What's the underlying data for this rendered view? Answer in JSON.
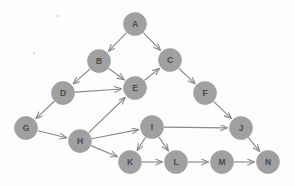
{
  "figure": {
    "kind": "directed-graph",
    "title": "",
    "background_color": "#fdfdfd",
    "node_fill_color": "#a0a0a0",
    "node_label_color": "#4a4a4a",
    "edge_color": "#8a8a8a",
    "node_radius": 11.5,
    "width": 295,
    "height": 186
  },
  "nodes": [
    {
      "id": "A",
      "label": "A",
      "x": 135,
      "y": 24
    },
    {
      "id": "B",
      "label": "B",
      "x": 99,
      "y": 61
    },
    {
      "id": "C",
      "label": "C",
      "x": 170,
      "y": 60
    },
    {
      "id": "D",
      "label": "D",
      "x": 63,
      "y": 93
    },
    {
      "id": "E",
      "label": "E",
      "x": 135,
      "y": 88
    },
    {
      "id": "F",
      "label": "F",
      "x": 205,
      "y": 93
    },
    {
      "id": "G",
      "label": "G",
      "x": 26,
      "y": 128
    },
    {
      "id": "H",
      "label": "H",
      "x": 80,
      "y": 141
    },
    {
      "id": "I",
      "label": "I",
      "x": 152,
      "y": 127
    },
    {
      "id": "J",
      "label": "J",
      "x": 241,
      "y": 128
    },
    {
      "id": "K",
      "label": "K",
      "x": 130,
      "y": 162
    },
    {
      "id": "L",
      "label": "L",
      "x": 176,
      "y": 162
    },
    {
      "id": "M",
      "label": "M",
      "x": 222,
      "y": 162
    },
    {
      "id": "N",
      "label": "N",
      "x": 268,
      "y": 162
    }
  ],
  "edges": [
    {
      "from": "A",
      "to": "B",
      "directed": true
    },
    {
      "from": "A",
      "to": "C",
      "directed": true
    },
    {
      "from": "B",
      "to": "D",
      "directed": true
    },
    {
      "from": "B",
      "to": "E",
      "directed": true
    },
    {
      "from": "D",
      "to": "E",
      "directed": true
    },
    {
      "from": "D",
      "to": "G",
      "directed": true
    },
    {
      "from": "E",
      "to": "C",
      "directed": true
    },
    {
      "from": "C",
      "to": "F",
      "directed": true
    },
    {
      "from": "F",
      "to": "J",
      "directed": true
    },
    {
      "from": "G",
      "to": "H",
      "directed": true
    },
    {
      "from": "H",
      "to": "E",
      "directed": true
    },
    {
      "from": "H",
      "to": "I",
      "directed": true
    },
    {
      "from": "H",
      "to": "K",
      "directed": true
    },
    {
      "from": "I",
      "to": "J",
      "directed": true
    },
    {
      "from": "I",
      "to": "K",
      "directed": true
    },
    {
      "from": "I",
      "to": "L",
      "directed": true
    },
    {
      "from": "J",
      "to": "N",
      "directed": true
    },
    {
      "from": "K",
      "to": "L",
      "directed": true
    },
    {
      "from": "L",
      "to": "M",
      "directed": true
    },
    {
      "from": "M",
      "to": "N",
      "directed": true
    }
  ],
  "artifacts": [
    {
      "x": 58,
      "y": 16,
      "size": 1.6
    },
    {
      "x": 34,
      "y": 53,
      "size": 1.4
    }
  ]
}
